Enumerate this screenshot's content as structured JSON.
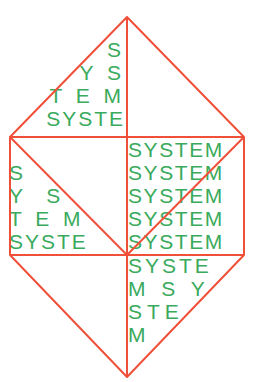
{
  "artwork": {
    "word": "SYSTEM",
    "colors": {
      "line": "#f0503a",
      "text": "#3aaa5c",
      "background": "#ffffff"
    },
    "top_left_triangle": [
      "S",
      "Y S",
      "T E M",
      "SYSTE"
    ],
    "middle_left_box": [
      "S",
      "Y  S",
      "T E M",
      "SYSTE"
    ],
    "middle_right_box": [
      "SYSTEM",
      "SYSTEM",
      "SYSTEM",
      "SYSTEM",
      "SYSTEM"
    ],
    "bottom_right_triangle": [
      "SYSTE",
      "M S Y",
      "STE",
      "M"
    ]
  }
}
